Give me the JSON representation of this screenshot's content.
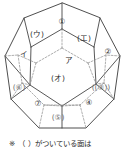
{
  "figure": {
    "name": "dodecahedron-diagram",
    "shape": "regular dodecahedron",
    "faces": [
      {
        "id": "f1",
        "label": "①",
        "hidden": false,
        "x": 62,
        "y": 22
      },
      {
        "id": "f2",
        "label": "②",
        "hidden": false,
        "x": 108,
        "y": 52
      },
      {
        "id": "f3",
        "label": "((③))",
        "hidden": true,
        "x": 101,
        "y": 88
      },
      {
        "id": "f4",
        "label": "④",
        "hidden": false,
        "x": 89,
        "y": 103
      },
      {
        "id": "f5",
        "label": "(⑤)",
        "hidden": true,
        "x": 58,
        "y": 118
      },
      {
        "id": "f6",
        "label": "(⑥)",
        "hidden": true,
        "x": 19,
        "y": 88
      },
      {
        "id": "f7",
        "label": "⑦",
        "hidden": false,
        "x": 38,
        "y": 104
      },
      {
        "id": "fa",
        "label": "ア",
        "hidden": false,
        "x": 69,
        "y": 61
      },
      {
        "id": "fi",
        "label": "イ",
        "hidden": false,
        "x": 24,
        "y": 55
      },
      {
        "id": "fu",
        "label": "(ウ)",
        "hidden": false,
        "x": 37,
        "y": 35
      },
      {
        "id": "fe",
        "label": "(エ)",
        "hidden": false,
        "x": 84,
        "y": 39
      },
      {
        "id": "fo",
        "label": "(オ)",
        "hidden": false,
        "x": 58,
        "y": 79
      }
    ],
    "outline_points": "62,3 24,18 5,56 11,99 39,128 86,128 114,99 120,56 100,18",
    "front_edges": [
      "M62,3 L62,29",
      "M62,29 L31,47",
      "M62,29 L94,47",
      "M24,18 L31,47",
      "M100,18 L94,47",
      "M31,47 L30,85",
      "M94,47 L96,84",
      "M5,56 L30,85",
      "M120,56 L96,84",
      "M30,85 L62,106",
      "M96,84 L62,106",
      "M62,106 L62,128",
      "M11,99 L30,85",
      "M114,99 L96,84"
    ],
    "hidden_edges": [
      "M62,29 L62,48",
      "M62,48 L36,63",
      "M62,48 L88,63",
      "M36,63 L30,85",
      "M88,63 L96,84",
      "M36,63 L18,55",
      "M88,63 L106,55",
      "M5,56 L18,55",
      "M120,56 L106,55",
      "M18,55 L22,83",
      "M106,55 L104,83",
      "M22,83 L30,85",
      "M104,83 L96,84",
      "M11,99 L22,83",
      "M114,99 L104,83",
      "M22,83 L44,105",
      "M104,83 L80,105",
      "M44,105 L80,105",
      "M44,105 L39,128",
      "M80,105 L86,128",
      "M62,106 L80,105",
      "M62,106 L44,105"
    ]
  },
  "caption": {
    "mark": "※",
    "text": "（ ）がついている面は"
  },
  "colors": {
    "stroke_front": "#3a3a3a",
    "stroke_hidden": "#8d8d8d",
    "label": "#2b2b2b",
    "background": "#ffffff"
  }
}
